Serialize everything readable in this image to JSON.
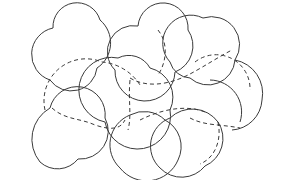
{
  "diagram": {
    "width": 283,
    "height": 180,
    "background": "#ffffff",
    "stroke_color": "#3a3a3a",
    "solid_shapes": [
      {
        "id": "top-left",
        "d": "M 50 80 A 27 27 0 0 1 53 28 A 24 24 0 0 1 100 20 A 30 30 0 0 1 97 68 A 26 26 0 0 1 50 80 Z"
      },
      {
        "id": "top-center",
        "d": "M 115 70 A 26 26 0 0 1 138 26 A 24 24 0 0 1 188 30 A 28 28 0 0 1 175 72 A 27 27 0 0 1 115 70 Z"
      },
      {
        "id": "top-right",
        "d": "M 170 62 A 28 28 0 0 1 203 18 A 28 28 0 0 1 235 60 A 27 27 0 0 1 190 78 A 22 22 0 0 1 170 62 Z"
      },
      {
        "id": "middle-center",
        "d": "M 105 122 A 30 30 0 0 1 118 58 A 24 24 0 0 1 150 68 A 30 30 0 0 1 170 110 A 30 30 0 0 1 105 122 Z"
      },
      {
        "id": "middle-right",
        "d": "M 235 60 A 34 34 0 0 1 262 100 A 32 32 0 0 1 232 130"
      },
      {
        "id": "bottom-left",
        "d": "M 40 162 A 36 36 0 0 1 50 108 A 28 28 0 0 1 105 118 A 28 28 0 0 1 78 159 A 26 26 0 0 1 40 162 Z"
      },
      {
        "id": "bottom-center",
        "d": "M 120 168 A 32 32 0 0 1 130 115 A 30 30 0 0 1 165 120 A 30 30 0 0 1 178 160 A 34 34 0 0 1 120 168 Z"
      },
      {
        "id": "bottom-right",
        "d": "M 160 168 A 30 30 0 0 1 170 118 A 32 32 0 0 1 218 122 A 30 30 0 0 1 205 166 A 30 30 0 0 1 160 168 Z"
      },
      {
        "id": "right-upper-arc",
        "d": "M 240 122 A 32 32 0 0 0 210 80"
      }
    ],
    "dashed_shapes": [
      {
        "id": "left-mid-dashed",
        "d": "M 45 110 A 42 42 0 0 1 102 62 A 50 50 0 0 1 140 85"
      },
      {
        "id": "left-mid-dashed-lower",
        "d": "M 52 108 C 65 120, 80 118, 95 125 C 110 130, 120 130, 125 120"
      },
      {
        "id": "center-dashed-vertical",
        "d": "M 158 30 C 170 45, 165 65, 158 75"
      },
      {
        "id": "center-dashed-cross",
        "d": "M 130 78 C 150 90, 175 82, 190 74 C 205 66, 220 56, 232 50"
      },
      {
        "id": "right-dashed-arc",
        "d": "M 195 62 A 34 34 0 0 1 250 90"
      },
      {
        "id": "right-dashed-lower",
        "d": "M 190 118 C 205 126, 220 124, 240 128"
      },
      {
        "id": "bottom-center-dashed",
        "d": "M 140 120 C 160 110, 185 104, 205 112"
      },
      {
        "id": "bottom-right-dashed",
        "d": "M 218 122 C 222 140, 215 158, 200 164"
      },
      {
        "id": "mid-center-dashed-vertical",
        "d": "M 130 80 C 128 100, 132 115, 128 130"
      }
    ]
  }
}
